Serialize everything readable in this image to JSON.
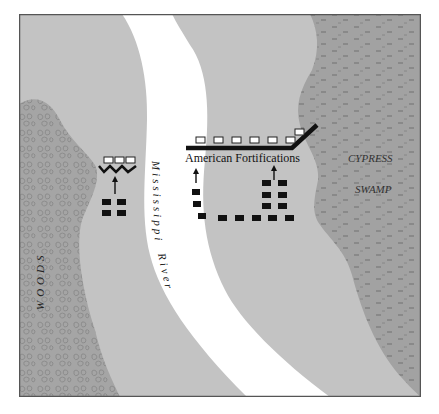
{
  "map": {
    "colors": {
      "ground": "#c3c3c3",
      "river": "#ffffff",
      "woods": "#a5a5a5",
      "woods_texture": "#7f7f7f",
      "swamp": "#a2a2a2",
      "swamp_texture": "#6e6e6e",
      "frame": "#555555",
      "troops": "#111111",
      "british_units": "#ffffff"
    },
    "labels": {
      "river_name_1": "Mississippi",
      "river_name_2": "River",
      "woods": "WOODS",
      "swamp_1": "CYPRESS",
      "swamp_2": "SWAMP",
      "fortifications": "American Fortifications"
    },
    "legend_symbols": {
      "white_rect": "unit-position-icon",
      "black_rect": "troop-unit-icon",
      "arrow": "advance-arrow-icon",
      "thick_line": "fortification-line",
      "zigzag": "west-bank-defense-line"
    }
  }
}
